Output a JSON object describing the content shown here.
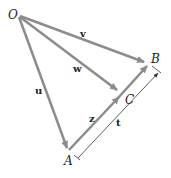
{
  "diagram": {
    "points": {
      "O": {
        "label": "O",
        "x": 18,
        "y": 15
      },
      "A": {
        "label": "A",
        "x": 69,
        "y": 152
      },
      "B": {
        "label": "B",
        "x": 148,
        "y": 62
      },
      "C": {
        "label": "C",
        "x": 118,
        "y": 92
      }
    },
    "vectors": {
      "u": {
        "label": "u",
        "from": "O",
        "to": "A"
      },
      "v": {
        "label": "v",
        "from": "O",
        "to": "B"
      },
      "w": {
        "label": "w",
        "from": "O",
        "to": "C"
      },
      "z": {
        "label": "z",
        "from": "A",
        "to": "C"
      }
    },
    "dimension": {
      "label": "t",
      "from": "A",
      "to": "B"
    },
    "colors": {
      "arrow": "#8c8c8c",
      "text": "#222222",
      "dimension": "#444444"
    }
  }
}
